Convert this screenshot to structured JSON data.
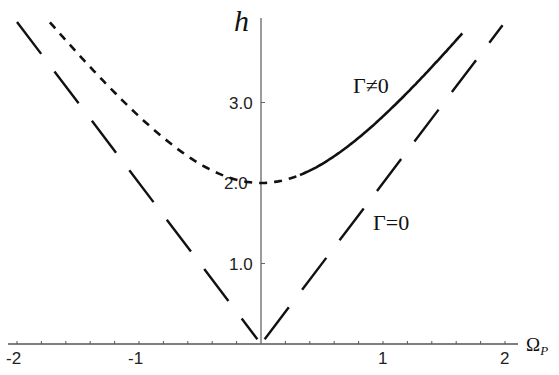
{
  "chart_data": {
    "type": "line",
    "title": "",
    "xlabel": "Ω_P",
    "ylabel": "h",
    "xlim": [
      -2.05,
      2.0
    ],
    "ylim": [
      0,
      4.1
    ],
    "grid": false,
    "x_ticks": [
      -2,
      -1,
      1,
      2
    ],
    "x_tick_labels": [
      "-2",
      "-1",
      "1",
      "2"
    ],
    "x_minor_step": 0.2,
    "y_ticks": [
      1.0,
      2.0,
      3.0
    ],
    "y_tick_labels": [
      "1.0",
      "2.0",
      "3.0"
    ],
    "series": [
      {
        "name": "Γ≠0 (unstable branch)",
        "style": "dotted",
        "formula": "h = 2*sqrt(Ω_P^2 + 1)",
        "x": [
          -1.73,
          -1.5,
          -1.25,
          -1.0,
          -0.75,
          -0.5,
          -0.25,
          0.0,
          0.15,
          0.32
        ],
        "values": [
          4.0,
          3.61,
          3.2,
          2.83,
          2.5,
          2.24,
          2.06,
          2.0,
          2.02,
          2.1
        ]
      },
      {
        "name": "Γ≠0",
        "style": "solid",
        "formula": "h = 2*sqrt(Ω_P^2 + 1)",
        "x": [
          0.32,
          0.5,
          0.75,
          1.0,
          1.25,
          1.5,
          1.65
        ],
        "values": [
          2.1,
          2.24,
          2.5,
          2.83,
          3.2,
          3.61,
          3.87
        ]
      },
      {
        "name": "Γ=0",
        "style": "dashed",
        "formula": "h = 2*|Ω_P|",
        "x": [
          -2.0,
          -1.5,
          -1.0,
          -0.5,
          0.0,
          0.5,
          1.0,
          1.5,
          2.0
        ],
        "values": [
          4.0,
          3.0,
          2.0,
          1.0,
          0.0,
          1.0,
          2.0,
          3.0,
          4.0
        ]
      }
    ],
    "annotations": [
      {
        "text": "Γ≠0",
        "x": 0.85,
        "y": 2.95
      },
      {
        "text": "Γ=0",
        "x": 0.95,
        "y": 1.25
      }
    ]
  },
  "labels": {
    "y_axis": "h",
    "x_axis_main": "Ω",
    "x_axis_sub": "P",
    "gamma_nonzero": "Γ≠0",
    "gamma_zero": "Γ=0",
    "xt": [
      "-2",
      "-1",
      "1",
      "2"
    ],
    "yt": [
      "1.0",
      "2.0",
      "3.0"
    ]
  }
}
